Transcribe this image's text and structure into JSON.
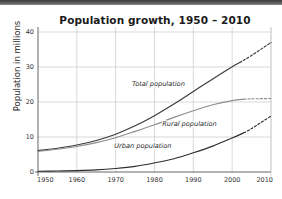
{
  "chart_data": {
    "type": "line",
    "title": "Population growth, 1950 – 2010",
    "xlabel": "",
    "ylabel": "Population in millions",
    "xlim": [
      1950,
      2010
    ],
    "ylim": [
      0,
      40
    ],
    "xticks": [
      "1950",
      "1960",
      "1970",
      "1980",
      "1990",
      "2000",
      "2010"
    ],
    "yticks": [
      "0",
      "10",
      "20",
      "30",
      "40"
    ],
    "grid": "horizontal-and-vertical",
    "legend_position": "inline-labels",
    "projection_note": "dashed segments after about 2003 are projections",
    "series": [
      {
        "name": "Total population",
        "label": "Total population",
        "color": "#3a3a3a",
        "x": [
          1950,
          1955,
          1960,
          1965,
          1970,
          1975,
          1980,
          1985,
          1990,
          1995,
          2000,
          2002,
          2005,
          2010
        ],
        "values": [
          6.1,
          6.8,
          7.7,
          9.0,
          10.8,
          13.2,
          16.1,
          19.4,
          23.0,
          26.6,
          30.1,
          31.3,
          33.3,
          37.0
        ],
        "solid_until": 2002,
        "label_x": 1981,
        "label_y": 24.6
      },
      {
        "name": "Rural population",
        "label": "Rural population",
        "color": "#8d8d8d",
        "x": [
          1950,
          1955,
          1960,
          1965,
          1970,
          1975,
          1980,
          1985,
          1990,
          1995,
          2000,
          2003,
          2005,
          2010
        ],
        "values": [
          5.9,
          6.5,
          7.3,
          8.4,
          9.8,
          11.6,
          13.5,
          15.6,
          17.5,
          19.2,
          20.4,
          20.8,
          20.9,
          21.0
        ],
        "solid_until": 2003,
        "label_x": 1989,
        "label_y": 13.2
      },
      {
        "name": "Urban population",
        "label": "Urban population",
        "color": "#2e2e2e",
        "x": [
          1950,
          1955,
          1960,
          1965,
          1970,
          1975,
          1980,
          1985,
          1990,
          1995,
          2000,
          2003,
          2005,
          2010
        ],
        "values": [
          0.2,
          0.3,
          0.4,
          0.6,
          1.0,
          1.6,
          2.6,
          3.8,
          5.5,
          7.4,
          9.7,
          11.2,
          12.4,
          16.0
        ],
        "solid_until": 2003,
        "label_x": 1977,
        "label_y": 7.0
      }
    ]
  }
}
